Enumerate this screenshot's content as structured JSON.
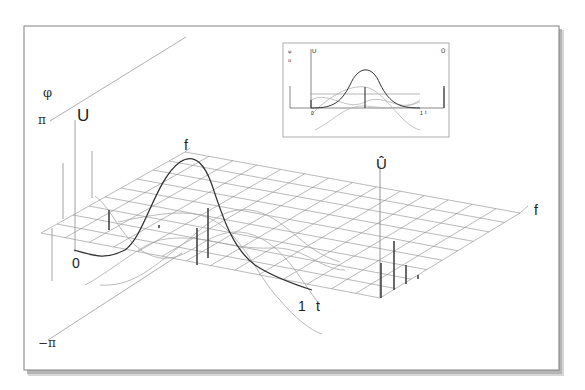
{
  "diagram": {
    "type": "3d-time-frequency-phase-plot",
    "colors": {
      "paper": "#ffffff",
      "frame": "#777777",
      "shadow": "#9a9a9a",
      "grid": "#8a8a8a",
      "curve_main": "#333333",
      "curve_faint": "#aaaaaa",
      "spike": "#444444"
    },
    "labels": {
      "phi_axis": "φ",
      "pi_top": "π",
      "pi_bottom": "−π",
      "u_axis": "U",
      "u_hat_axis": "Û",
      "f_axis_back": "f",
      "f_axis_right": "f",
      "t_axis": "t",
      "t_origin": "0",
      "t_end": "1"
    },
    "inset": {
      "labels": {
        "phi": "φ",
        "pi": "π",
        "u": "U",
        "u_hat": "Û",
        "t_origin": "0",
        "t_end": "1",
        "t": "t"
      }
    }
  }
}
